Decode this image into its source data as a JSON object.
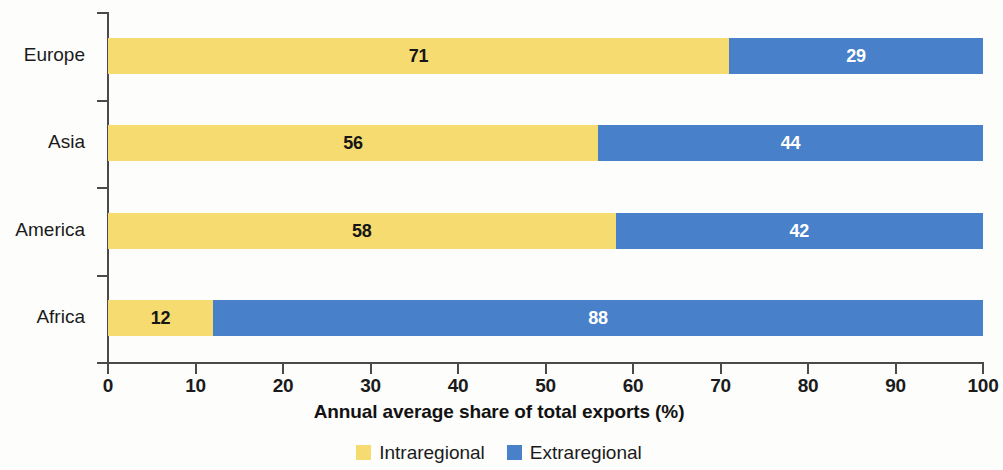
{
  "chart_data": {
    "type": "bar",
    "orientation": "horizontal",
    "stacked": true,
    "stack_total": 100,
    "title": "",
    "xlabel": "Annual average share of total exports (%)",
    "ylabel": "",
    "xlim": [
      0,
      100
    ],
    "xticks": [
      0,
      10,
      20,
      30,
      40,
      50,
      60,
      70,
      80,
      90,
      100
    ],
    "xtick_labels": [
      "0",
      "10",
      "20",
      "30",
      "40",
      "50",
      "60",
      "70",
      "80",
      "90",
      "100"
    ],
    "grid": false,
    "legend_position": "bottom-center",
    "categories": [
      "Europe",
      "Asia",
      "America",
      "Africa"
    ],
    "series": [
      {
        "name": "Intraregional",
        "color": "#f6dc70",
        "values": [
          71,
          56,
          58,
          12
        ],
        "value_labels": [
          "71",
          "56",
          "58",
          "12"
        ],
        "label_color": "#161616"
      },
      {
        "name": "Extraregional",
        "color": "#4880c9",
        "values": [
          29,
          44,
          42,
          88
        ],
        "value_labels": [
          "29",
          "44",
          "42",
          "88"
        ],
        "label_color": "#ffffff"
      }
    ]
  },
  "axes": {
    "x_title": "Annual average share of total exports (%)",
    "x_tick_labels": [
      "0",
      "10",
      "20",
      "30",
      "40",
      "50",
      "60",
      "70",
      "80",
      "90",
      "100"
    ],
    "y_tick_labels": [
      "Europe",
      "Asia",
      "America",
      "Africa"
    ]
  },
  "legend": {
    "items": [
      {
        "label": "Intraregional",
        "color": "#f6dc70"
      },
      {
        "label": "Extraregional",
        "color": "#4880c9"
      }
    ]
  },
  "colors": {
    "intraregional": "#f6dc70",
    "extraregional": "#4880c9",
    "axis": "#4a4a48",
    "text": "#1b1b1b",
    "background": "#fdfdfb"
  }
}
